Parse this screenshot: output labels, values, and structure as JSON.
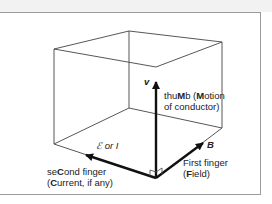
{
  "diagram": {
    "labels": {
      "v_symbol": "v",
      "thumb_line1_pre": "thu",
      "thumb_line1_bold1": "M",
      "thumb_line1_mid": "b (",
      "thumb_line1_bold2": "M",
      "thumb_line1_post": "otion",
      "thumb_line2": "of conductor)",
      "b_symbol": "B",
      "first_line1": "First finger",
      "first_line2_pre": "(",
      "first_line2_bold": "F",
      "first_line2_post": "ield)",
      "emf_symbol": "ℰ or I",
      "second_line1_pre": "se",
      "second_line1_bold": "C",
      "second_line1_post": "ond finger",
      "second_line2_pre": "(",
      "second_line2_bold": "C",
      "second_line2_post": "urrent, if any)"
    },
    "vectors": [
      {
        "name": "thumb",
        "symbol": "v",
        "meaning": "Motion of conductor"
      },
      {
        "name": "first-finger",
        "symbol": "B",
        "meaning": "Field"
      },
      {
        "name": "second-finger",
        "symbol": "ℰ or I",
        "meaning": "Current, if any"
      }
    ],
    "colors": {
      "line": "#333333",
      "arrow": "#111111",
      "frame": "#9a9a9a"
    }
  }
}
